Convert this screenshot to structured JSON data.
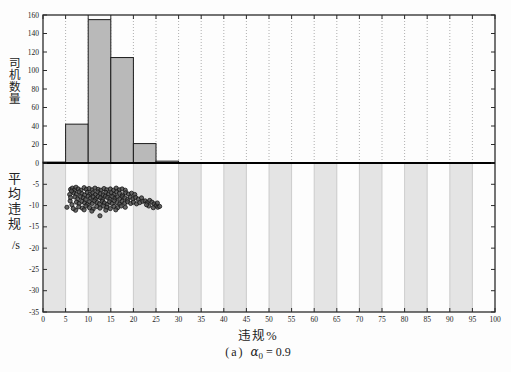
{
  "figure": {
    "caption": {
      "prefix": "(a)",
      "symbol": "α",
      "subscript": "0",
      "rest": " = 0.9"
    }
  },
  "chart_data": {
    "type": [
      "bar",
      "scatter"
    ],
    "xlabel": "违规%",
    "xlim": [
      0,
      100
    ],
    "xticks": [
      0,
      5,
      10,
      15,
      20,
      25,
      30,
      35,
      40,
      45,
      50,
      55,
      60,
      65,
      70,
      75,
      80,
      85,
      90,
      95,
      100
    ],
    "grid": "dotted-vertical-top-panel",
    "top_panel": {
      "type": "bar",
      "ylabel": "司机数量",
      "ylim": [
        0,
        160
      ],
      "yticks": [
        0,
        20,
        40,
        60,
        80,
        100,
        120,
        140,
        160
      ],
      "bin_width": 5,
      "bin_starts": [
        0,
        5,
        10,
        15,
        20,
        25
      ],
      "values": [
        1,
        42,
        155,
        114,
        21,
        2
      ]
    },
    "bottom_panel": {
      "type": "scatter",
      "ylabel": "平均违规",
      "ylabel_unit": "/s",
      "ylim": [
        -35,
        0
      ],
      "yticks": [
        -5,
        -10,
        -15,
        -20,
        -25,
        -30,
        -35
      ],
      "bands": [
        [
          0,
          5
        ],
        [
          10,
          15
        ],
        [
          20,
          25
        ],
        [
          30,
          35
        ],
        [
          40,
          45
        ],
        [
          50,
          55
        ],
        [
          60,
          65
        ],
        [
          70,
          75
        ],
        [
          80,
          85
        ],
        [
          90,
          95
        ]
      ],
      "points": [
        [
          6.1,
          -6.2
        ],
        [
          6.5,
          -5.9
        ],
        [
          7.0,
          -6.3
        ],
        [
          7.3,
          -5.7
        ],
        [
          7.8,
          -6.1
        ],
        [
          8.4,
          -6.4
        ],
        [
          9.1,
          -5.8
        ],
        [
          9.6,
          -6.2
        ],
        [
          10.2,
          -6.0
        ],
        [
          10.9,
          -6.3
        ],
        [
          11.5,
          -5.9
        ],
        [
          12.2,
          -6.2
        ],
        [
          12.8,
          -6.4
        ],
        [
          13.5,
          -6.0
        ],
        [
          14.1,
          -6.3
        ],
        [
          14.9,
          -6.1
        ],
        [
          15.6,
          -6.4
        ],
        [
          16.2,
          -5.9
        ],
        [
          16.9,
          -6.3
        ],
        [
          17.5,
          -6.1
        ],
        [
          18.2,
          -6.4
        ],
        [
          6.8,
          -7.0
        ],
        [
          7.4,
          -7.3
        ],
        [
          8.0,
          -6.8
        ],
        [
          8.6,
          -7.2
        ],
        [
          9.2,
          -7.5
        ],
        [
          9.8,
          -6.9
        ],
        [
          10.4,
          -7.3
        ],
        [
          11.0,
          -7.0
        ],
        [
          11.6,
          -7.4
        ],
        [
          12.1,
          -6.8
        ],
        [
          12.7,
          -7.2
        ],
        [
          13.3,
          -7.5
        ],
        [
          13.9,
          -6.9
        ],
        [
          14.5,
          -7.3
        ],
        [
          15.1,
          -7.0
        ],
        [
          15.7,
          -7.4
        ],
        [
          16.3,
          -6.8
        ],
        [
          16.9,
          -7.1
        ],
        [
          17.6,
          -7.5
        ],
        [
          18.3,
          -7.0
        ],
        [
          18.9,
          -7.3
        ],
        [
          19.6,
          -7.1
        ],
        [
          20.3,
          -7.4
        ],
        [
          7.1,
          -8.0
        ],
        [
          7.7,
          -8.4
        ],
        [
          8.3,
          -7.9
        ],
        [
          8.9,
          -8.2
        ],
        [
          9.4,
          -8.6
        ],
        [
          10.0,
          -7.8
        ],
        [
          10.5,
          -8.3
        ],
        [
          11.1,
          -8.0
        ],
        [
          11.6,
          -8.5
        ],
        [
          12.2,
          -7.9
        ],
        [
          12.7,
          -8.2
        ],
        [
          13.2,
          -8.6
        ],
        [
          13.8,
          -7.8
        ],
        [
          14.3,
          -8.1
        ],
        [
          14.8,
          -8.5
        ],
        [
          15.4,
          -7.9
        ],
        [
          15.9,
          -8.3
        ],
        [
          16.5,
          -8.0
        ],
        [
          17.0,
          -8.4
        ],
        [
          17.6,
          -7.9
        ],
        [
          18.1,
          -8.2
        ],
        [
          18.7,
          -8.6
        ],
        [
          19.3,
          -8.0
        ],
        [
          19.9,
          -8.4
        ],
        [
          20.5,
          -8.1
        ],
        [
          21.1,
          -8.5
        ],
        [
          21.8,
          -8.2
        ],
        [
          7.4,
          -9.2
        ],
        [
          8.0,
          -9.5
        ],
        [
          8.6,
          -9.0
        ],
        [
          9.2,
          -9.4
        ],
        [
          9.8,
          -9.7
        ],
        [
          10.3,
          -9.1
        ],
        [
          10.9,
          -9.5
        ],
        [
          11.4,
          -8.9
        ],
        [
          12.0,
          -9.3
        ],
        [
          12.5,
          -9.6
        ],
        [
          13.1,
          -9.0
        ],
        [
          13.6,
          -9.4
        ],
        [
          14.2,
          -9.7
        ],
        [
          14.7,
          -9.1
        ],
        [
          15.3,
          -9.5
        ],
        [
          15.8,
          -8.9
        ],
        [
          16.4,
          -9.3
        ],
        [
          17.0,
          -9.6
        ],
        [
          17.5,
          -9.0
        ],
        [
          18.1,
          -9.4
        ],
        [
          18.7,
          -9.1
        ],
        [
          19.4,
          -9.5
        ],
        [
          20.0,
          -9.2
        ],
        [
          20.7,
          -9.6
        ],
        [
          21.4,
          -9.3
        ],
        [
          22.1,
          -9.0
        ],
        [
          7.9,
          -10.3
        ],
        [
          8.7,
          -10.6
        ],
        [
          9.5,
          -10.1
        ],
        [
          10.3,
          -10.5
        ],
        [
          11.1,
          -10.8
        ],
        [
          11.9,
          -10.2
        ],
        [
          12.6,
          -10.6
        ],
        [
          13.4,
          -10.1
        ],
        [
          14.1,
          -10.4
        ],
        [
          14.9,
          -10.7
        ],
        [
          15.7,
          -10.2
        ],
        [
          16.5,
          -10.5
        ],
        [
          17.3,
          -10.1
        ],
        [
          18.2,
          -10.4
        ],
        [
          22.6,
          -8.9
        ],
        [
          23.1,
          -9.3
        ],
        [
          23.6,
          -8.8
        ],
        [
          24.1,
          -9.2
        ],
        [
          24.6,
          -9.6
        ],
        [
          25.0,
          -10.0
        ],
        [
          25.4,
          -10.4
        ],
        [
          25.8,
          -10.2
        ],
        [
          25.3,
          -9.4
        ],
        [
          24.4,
          -10.5
        ],
        [
          23.4,
          -10.1
        ],
        [
          22.9,
          -9.8
        ],
        [
          5.3,
          -10.4
        ],
        [
          6.0,
          -8.9
        ],
        [
          6.4,
          -9.8
        ],
        [
          7.2,
          -11.1
        ],
        [
          6.7,
          -10.7
        ],
        [
          12.6,
          -12.4
        ],
        [
          10.8,
          -11.3
        ],
        [
          13.9,
          -11.1
        ],
        [
          16.1,
          -11.0
        ],
        [
          9.1,
          -11.0
        ],
        [
          6.3,
          -6.6
        ],
        [
          5.9,
          -7.4
        ],
        [
          6.1,
          -8.1
        ]
      ]
    },
    "colors": {
      "bar_fill": "#b9b9b9",
      "bar_edge": "#1c1c1c",
      "band_fill": "#e4e4e4",
      "band_line": "#c3c3c3",
      "grid_dotted": "#9a9a9a",
      "point_fill": "#4f4f4f",
      "point_edge": "#141414",
      "axis": "#2b2b2b",
      "zero_line": "#000000",
      "tick_label": "#222222"
    }
  }
}
